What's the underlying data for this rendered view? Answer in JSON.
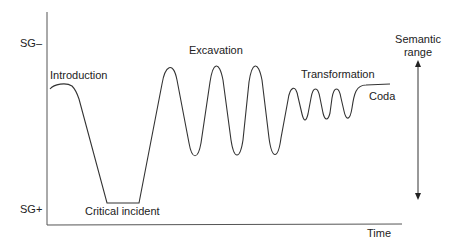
{
  "axes": {
    "y_top_label": "SG–",
    "y_bottom_label": "SG+",
    "x_label": "Time"
  },
  "phases": [
    {
      "label": "Introduction"
    },
    {
      "label": "Critical incident"
    },
    {
      "label": "Excavation"
    },
    {
      "label": "Transformation"
    },
    {
      "label": "Coda"
    }
  ],
  "range_indicator": {
    "line1": "Semantic",
    "line2": "range"
  },
  "colors": {
    "line": "#333333",
    "axis": "#555555",
    "background": "#ffffff"
  },
  "curve_points": [
    [
      50,
      88
    ],
    [
      62,
      84
    ],
    [
      72,
      87
    ],
    [
      78,
      97
    ],
    [
      107,
      203
    ],
    [
      139,
      203
    ],
    [
      169,
      64
    ],
    [
      195,
      158
    ],
    [
      216,
      62
    ],
    [
      236,
      157
    ],
    [
      254,
      63
    ],
    [
      274,
      156
    ],
    [
      293,
      88
    ],
    [
      304,
      119
    ],
    [
      315,
      88
    ],
    [
      326,
      118
    ],
    [
      336,
      88
    ],
    [
      348,
      118
    ],
    [
      360,
      86
    ],
    [
      390,
      84
    ]
  ]
}
